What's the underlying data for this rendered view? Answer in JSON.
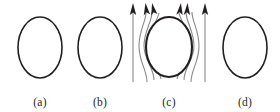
{
  "figure": {
    "caption_labels": [
      "(a)",
      "(b)",
      "(c)",
      "(d)"
    ],
    "background_color": "#ffffff",
    "outline_color": "#231f20",
    "fieldline_color": "#808080",
    "arrow_color": "#231f20"
  },
  "panels": [
    {
      "id": "a",
      "label": "(a)",
      "shape": "ellipse",
      "description": "plain ellipse outline"
    },
    {
      "id": "b",
      "label": "(b)",
      "shape": "ellipse",
      "description": "plain ellipse outline"
    },
    {
      "id": "c",
      "label": "(c)",
      "shape": "ellipse-with-field-lines",
      "description": "ellipse surrounded by upward field lines with arrowheads",
      "arrow_count": 6
    },
    {
      "id": "d",
      "label": "(d)",
      "shape": "ellipse",
      "description": "plain ellipse outline"
    }
  ]
}
